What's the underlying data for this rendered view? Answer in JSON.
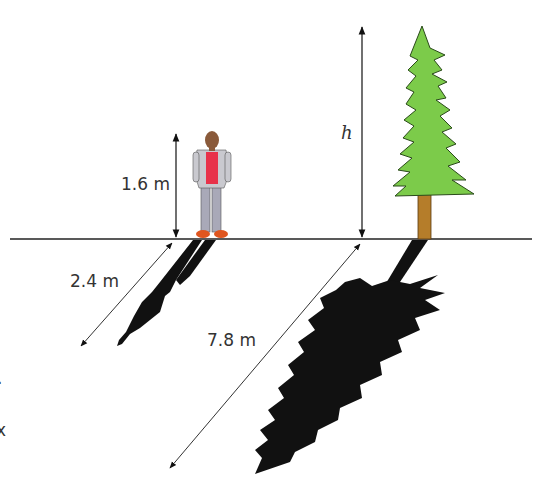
{
  "diagram": {
    "type": "similar-triangles-shadow",
    "colors": {
      "ground": "#222222",
      "tree_foliage": "#7ccb4a",
      "tree_outline": "#2a4a1a",
      "tree_trunk": "#b57d2a",
      "shadow": "#111111",
      "shirt_red": "#e8324a",
      "shirt_grey": "#c9c9cf",
      "pants": "#a9a9b8",
      "shoes": "#e0561f"
    },
    "labels": {
      "person_height": "1.6 m",
      "tree_height": "h",
      "person_shadow": "2.4 m",
      "tree_shadow": "7.8 m"
    },
    "left_edge_fragments": [
      ".",
      "x"
    ]
  }
}
